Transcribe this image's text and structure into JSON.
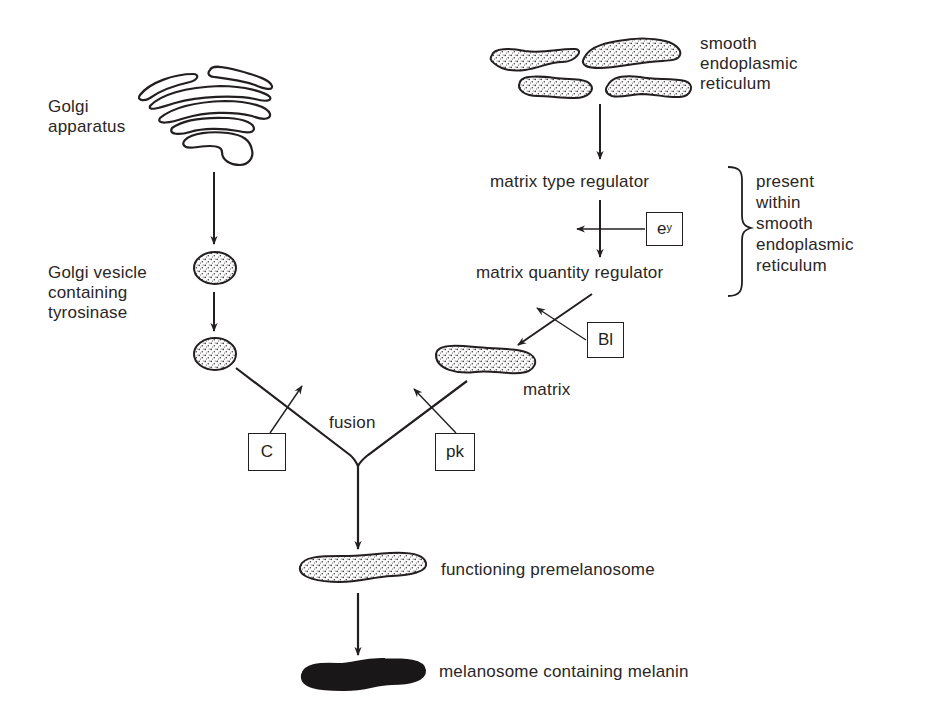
{
  "diagram": {
    "nodes": {
      "golgi_apparatus": {
        "label_line1": "Golgi",
        "label_line2": "apparatus"
      },
      "smooth_er": {
        "label_line1": "smooth",
        "label_line2": "endoplasmic",
        "label_line3": "reticulum"
      },
      "matrix_type_regulator": {
        "label": "matrix type regulator"
      },
      "matrix_quantity_regulator": {
        "label": "matrix quantity regulator"
      },
      "golgi_vesicle": {
        "label_line1": "Golgi vesicle",
        "label_line2": "containing",
        "label_line3": "tyrosinase"
      },
      "matrix": {
        "label": "matrix"
      },
      "fusion": {
        "label": "fusion"
      },
      "functioning_premelanosome": {
        "label": "functioning premelanosome"
      },
      "melanosome": {
        "label": "melanosome containing melanin"
      }
    },
    "bracket_note": {
      "line1": "present",
      "line2": "within",
      "line3": "smooth",
      "line4": "endoplasmic",
      "line5": "reticulum"
    },
    "gene_boxes": {
      "ey": {
        "base": "e",
        "sup": "y"
      },
      "bl": {
        "label": "Bl"
      },
      "c": {
        "label": "C"
      },
      "pk": {
        "label": "pk"
      }
    },
    "colors": {
      "ink": "#231f20",
      "background": "#ffffff",
      "stipple_fill": "#e9e6e2",
      "melanin_fill": "#1a1718"
    }
  }
}
